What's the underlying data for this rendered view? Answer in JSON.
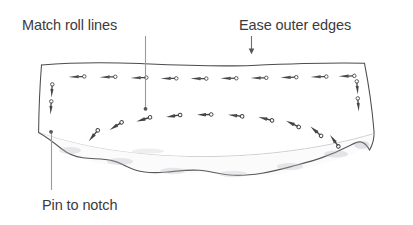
{
  "figure": {
    "background_color": "#ffffff",
    "ink_color": "#4a4a4c",
    "text_color": "#3b3b3d",
    "faint_color": "#c9c9cc"
  },
  "annotations": [
    {
      "id": "match-roll-lines",
      "label": "Match roll lines",
      "leader": "vertical-line-with-dot",
      "points_to": "upper-panel-center"
    },
    {
      "id": "ease-outer-edges",
      "label": "Ease outer edges",
      "leader": "down-arrow",
      "points_to": "panel-top-edge"
    },
    {
      "id": "pin-to-notch",
      "label": "Pin to notch",
      "leader": "vertical-line-with-dot",
      "points_to": "lower-left-notch"
    }
  ],
  "panel": {
    "name": "fabric-panel",
    "top_edge": "hand-drawn-irregular",
    "bottom_edge": "wavy-gathered-ruffle",
    "seam_line": "faint-arc"
  },
  "pin_rows": [
    {
      "id": "top-row",
      "orientation": "horizontal",
      "count": 10,
      "description": "Evenly spaced pins along the straight upper seam"
    },
    {
      "id": "arc-row",
      "orientation": "along-curve",
      "count": 10,
      "description": "Pins following the curved ruffle seam"
    },
    {
      "id": "left-edge",
      "orientation": "vertical",
      "count": 2,
      "description": "Vertical pins at left side seam"
    },
    {
      "id": "right-edge",
      "orientation": "vertical",
      "count": 2,
      "description": "Vertical pins at right side seam"
    }
  ]
}
